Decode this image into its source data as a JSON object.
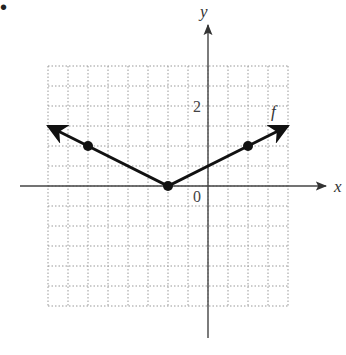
{
  "chart_data": {
    "type": "line",
    "title": "",
    "function_label": "f",
    "xlabel": "x",
    "ylabel": "y",
    "tick_labels": {
      "origin": "0",
      "y_tick": "2"
    },
    "grid": {
      "on": true,
      "style": "dotted",
      "unit_per_cell": 0.5
    },
    "xlim": [
      -4,
      2
    ],
    "ylim": [
      -3,
      3
    ],
    "series": [
      {
        "name": "f",
        "description": "f(x) = 0.5|x + 1|",
        "x": [
          -4,
          -3,
          -1,
          1,
          2
        ],
        "y": [
          1.5,
          1,
          0,
          1,
          1.5
        ],
        "marked_points": [
          [
            -3,
            1
          ],
          [
            -1,
            0
          ],
          [
            1,
            1
          ]
        ],
        "arrows_at_ends": true
      }
    ]
  },
  "bullet": "•",
  "colors": {
    "curve": "#111111",
    "axis": "#444444",
    "grid": "#999999"
  }
}
